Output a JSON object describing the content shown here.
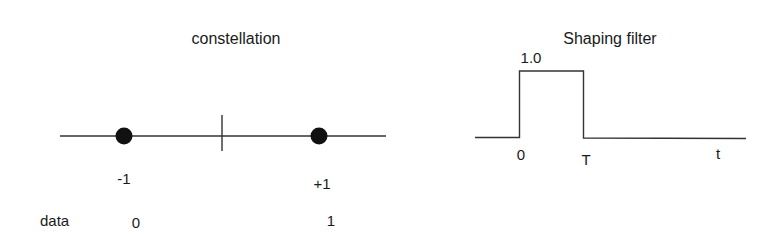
{
  "constellation": {
    "title": "constellation",
    "points": [
      {
        "symbol": "-1",
        "data": "0"
      },
      {
        "symbol": "+1",
        "data": "1"
      }
    ],
    "row_label": "data"
  },
  "shaping_filter": {
    "title": "Shaping filter",
    "amplitude_label": "1.0",
    "start_label": "0",
    "end_label": "T",
    "axis_label": "t"
  },
  "colors": {
    "stroke": "#333333",
    "dot": "#111111",
    "text": "#1a1a1a"
  }
}
